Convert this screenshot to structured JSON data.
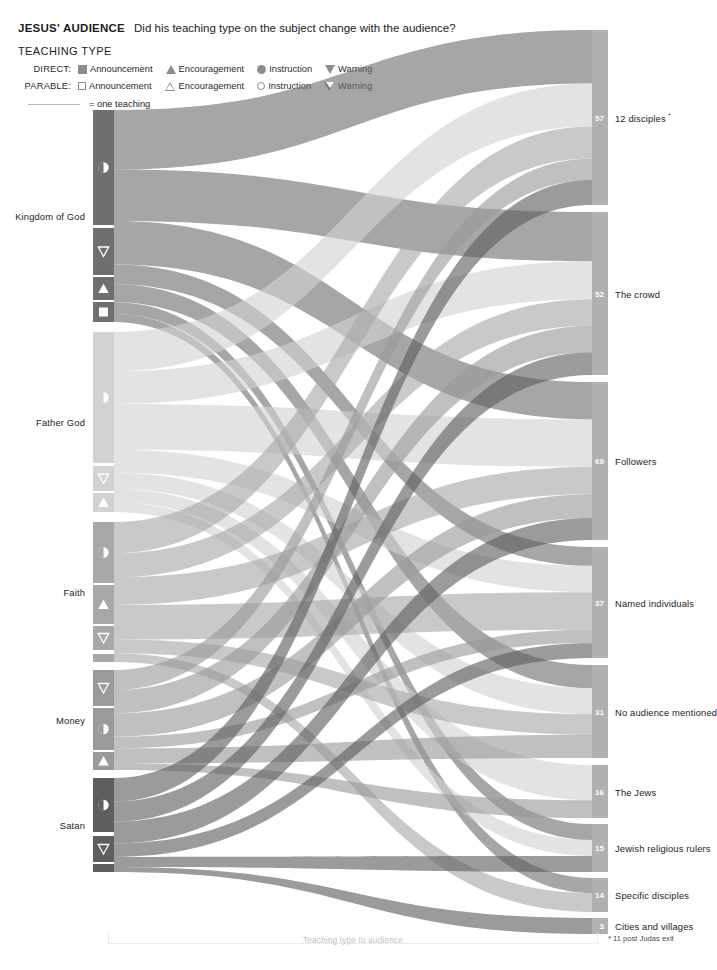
{
  "header": {
    "title": "JESUS' AUDIENCE",
    "subtitle": "Did his teaching type on the subject change with the audience?",
    "legend_title": "TEACHING TYPE",
    "direct_label": "DIRECT:",
    "parable_label": "PARABLE:",
    "types": [
      "Announcement",
      "Encouragement",
      "Instruction",
      "Warning"
    ],
    "unit_label": "= one teaching"
  },
  "footer": {
    "axis_caption": "Teaching type to audience",
    "footnote": "* 11 post Judas exit"
  },
  "colors": {
    "kingdom_of_god": "#6f6f6f",
    "father_god": "#d2d2d2",
    "faith": "#a8a8a8",
    "money": "#9a9a9a",
    "satan": "#5e5e5e",
    "audience_node": "#b0b0b0",
    "glyph": "#8d8d8d",
    "text": "#1d1d1d"
  },
  "chart_data": {
    "type": "sankey",
    "title": "JESUS' AUDIENCE",
    "subtitle": "Did his teaching type on the subject change with the audience?",
    "xlabel": "Teaching type to audience",
    "legend": {
      "series": [
        "DIRECT",
        "PARABLE"
      ],
      "categories": [
        "Announcement",
        "Encouragement",
        "Instruction",
        "Warning"
      ],
      "unit": "one teaching"
    },
    "source_groups": [
      {
        "name": "Kingdom of God",
        "color": "#6f6f6f",
        "y0": 110,
        "y1": 322,
        "segments": [
          {
            "type": "Instruction",
            "glyph": "circle-half",
            "y0": 110,
            "y1": 225,
            "value": 115
          },
          {
            "type": "Warning",
            "glyph": "triangle-down",
            "y0": 228,
            "y1": 275,
            "value": 47
          },
          {
            "type": "Encouragement",
            "glyph": "triangle-up",
            "y0": 277,
            "y1": 300,
            "value": 23
          },
          {
            "type": "Announcement",
            "glyph": "square",
            "y0": 302,
            "y1": 322,
            "value": 20
          }
        ]
      },
      {
        "name": "Father God",
        "color": "#d2d2d2",
        "y0": 332,
        "y1": 512,
        "segments": [
          {
            "type": "Instruction",
            "glyph": "circle-half",
            "y0": 332,
            "y1": 463,
            "value": 131
          },
          {
            "type": "Warning",
            "glyph": "triangle-down",
            "y0": 466,
            "y1": 491,
            "value": 25
          },
          {
            "type": "Encouragement",
            "glyph": "triangle-up",
            "y0": 493,
            "y1": 512,
            "value": 19
          }
        ]
      },
      {
        "name": "Faith",
        "color": "#a8a8a8",
        "y0": 522,
        "y1": 662,
        "segments": [
          {
            "type": "Instruction",
            "glyph": "circle-half",
            "y0": 522,
            "y1": 583,
            "value": 61
          },
          {
            "type": "Encouragement",
            "glyph": "triangle-up",
            "y0": 585,
            "y1": 624,
            "value": 39
          },
          {
            "type": "Warning",
            "glyph": "triangle-down",
            "y0": 626,
            "y1": 650,
            "value": 24
          },
          {
            "type": "Announcement",
            "glyph": "square",
            "y0": 654,
            "y1": 662,
            "value": 8
          }
        ]
      },
      {
        "name": "Money",
        "color": "#9a9a9a",
        "y0": 670,
        "y1": 770,
        "segments": [
          {
            "type": "Warning",
            "glyph": "triangle-down",
            "y0": 670,
            "y1": 706,
            "value": 36
          },
          {
            "type": "Instruction",
            "glyph": "circle-half",
            "y0": 708,
            "y1": 750,
            "value": 42
          },
          {
            "type": "Encouragement",
            "glyph": "triangle-up",
            "y0": 752,
            "y1": 770,
            "value": 18
          }
        ]
      },
      {
        "name": "Satan",
        "color": "#5e5e5e",
        "y0": 778,
        "y1": 872,
        "segments": [
          {
            "type": "Instruction",
            "glyph": "circle-half",
            "y0": 778,
            "y1": 832,
            "value": 54
          },
          {
            "type": "Warning",
            "glyph": "triangle-down",
            "y0": 836,
            "y1": 862,
            "value": 26
          },
          {
            "type": "Encouragement",
            "glyph": "triangle-up",
            "y0": 864,
            "y1": 872,
            "value": 8
          }
        ]
      }
    ],
    "target_nodes": [
      {
        "name": "12 disciples",
        "value": 57,
        "y0": 30,
        "y1": 205,
        "note": "*"
      },
      {
        "name": "The crowd",
        "value": 52,
        "y0": 212,
        "y1": 375,
        "note": ""
      },
      {
        "name": "Followers",
        "value": 69,
        "y0": 382,
        "y1": 540,
        "note": ""
      },
      {
        "name": "Named individuals",
        "value": 37,
        "y0": 547,
        "y1": 658,
        "note": ""
      },
      {
        "name": "No audience mentioned",
        "value": 31,
        "y0": 665,
        "y1": 758,
        "note": ""
      },
      {
        "name": "The Jews",
        "value": 16,
        "y0": 765,
        "y1": 818,
        "note": ""
      },
      {
        "name": "Jewish religious rulers",
        "value": 15,
        "y0": 824,
        "y1": 872,
        "note": ""
      },
      {
        "name": "Specific disciples",
        "value": 14,
        "y0": 878,
        "y1": 912,
        "note": ""
      },
      {
        "name": "Cities and villages",
        "value": 3,
        "y0": 918,
        "y1": 934,
        "note": ""
      }
    ],
    "flows": [
      {
        "source": "Kingdom of God",
        "target": "12 disciples",
        "value": 30
      },
      {
        "source": "Kingdom of God",
        "target": "The crowd",
        "value": 26
      },
      {
        "source": "Kingdom of God",
        "target": "Followers",
        "value": 22
      },
      {
        "source": "Kingdom of God",
        "target": "Named individuals",
        "value": 10
      },
      {
        "source": "Kingdom of God",
        "target": "No audience mentioned",
        "value": 9
      },
      {
        "source": "Kingdom of God",
        "target": "Jewish religious rulers",
        "value": 6
      },
      {
        "source": "Kingdom of God",
        "target": "Specific disciples",
        "value": 4
      },
      {
        "source": "Father God",
        "target": "12 disciples",
        "value": 24
      },
      {
        "source": "Father God",
        "target": "The crowd",
        "value": 20
      },
      {
        "source": "Father God",
        "target": "Followers",
        "value": 28
      },
      {
        "source": "Father God",
        "target": "Named individuals",
        "value": 14
      },
      {
        "source": "Father God",
        "target": "No audience mentioned",
        "value": 10
      },
      {
        "source": "Father God",
        "target": "The Jews",
        "value": 8
      },
      {
        "source": "Father God",
        "target": "Jewish religious rulers",
        "value": 6
      },
      {
        "source": "Faith",
        "target": "12 disciples",
        "value": 18
      },
      {
        "source": "Faith",
        "target": "The crowd",
        "value": 14
      },
      {
        "source": "Faith",
        "target": "Followers",
        "value": 16
      },
      {
        "source": "Faith",
        "target": "Named individuals",
        "value": 20
      },
      {
        "source": "Faith",
        "target": "No audience mentioned",
        "value": 8
      },
      {
        "source": "Faith",
        "target": "Specific disciples",
        "value": 5
      },
      {
        "source": "Money",
        "target": "12 disciples",
        "value": 12
      },
      {
        "source": "Money",
        "target": "The crowd",
        "value": 14
      },
      {
        "source": "Money",
        "target": "Followers",
        "value": 14
      },
      {
        "source": "Money",
        "target": "Named individuals",
        "value": 7
      },
      {
        "source": "Money",
        "target": "No audience mentioned",
        "value": 9
      },
      {
        "source": "Money",
        "target": "The Jews",
        "value": 4
      },
      {
        "source": "Satan",
        "target": "12 disciples",
        "value": 14
      },
      {
        "source": "Satan",
        "target": "The crowd",
        "value": 12
      },
      {
        "source": "Satan",
        "target": "Followers",
        "value": 13
      },
      {
        "source": "Satan",
        "target": "Named individuals",
        "value": 8
      },
      {
        "source": "Satan",
        "target": "Jewish religious rulers",
        "value": 6
      },
      {
        "source": "Satan",
        "target": "Cities and villages",
        "value": 3
      }
    ]
  }
}
